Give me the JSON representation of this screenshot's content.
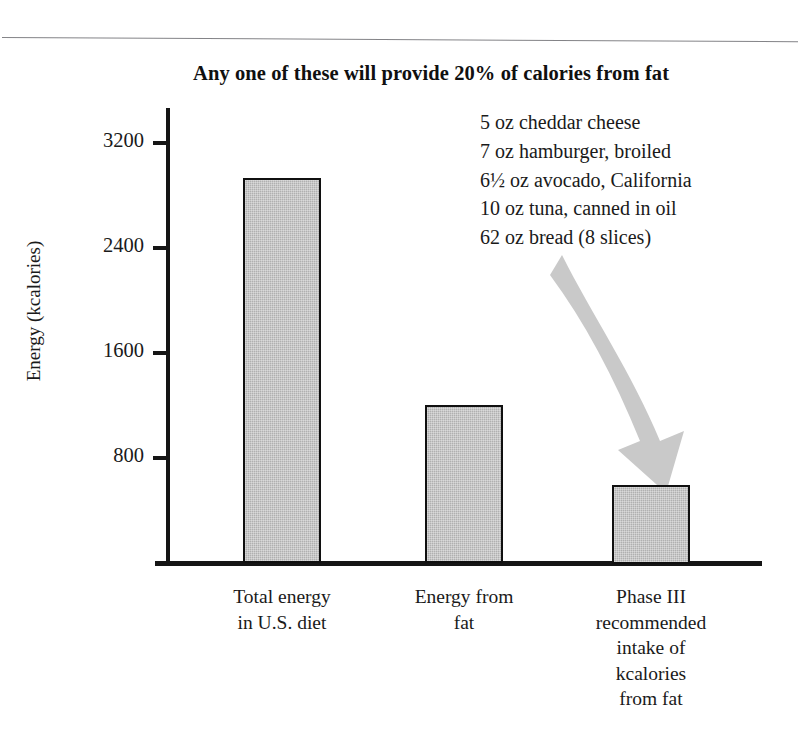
{
  "figure": {
    "title": "Any one of these will provide 20% of calories from fat",
    "y_axis_title": "Energy (kcalories)",
    "bar_fill_color": "#b0b0b0",
    "bar_border_color": "#101010",
    "arrow_color": "#c9c9c9"
  },
  "food_list": [
    "5 oz cheddar cheese",
    "7 oz hamburger, broiled",
    "6½ oz avocado, California",
    "10 oz tuna, canned in oil",
    "62 oz bread (8 slices)"
  ],
  "y_ticks": [
    {
      "label": "3200",
      "value": 3200
    },
    {
      "label": "2400",
      "value": 2400
    },
    {
      "label": "1600",
      "value": 1600
    },
    {
      "label": "800",
      "value": 800
    }
  ],
  "bars": [
    {
      "label_lines": [
        "Total energy",
        "in U.S. diet"
      ],
      "value": 2940
    },
    {
      "label_lines": [
        "Energy from",
        "fat"
      ],
      "value": 1210
    },
    {
      "label_lines": [
        "Phase III",
        "recommended",
        "intake of",
        "kcalories",
        "from fat"
      ],
      "value": 600
    }
  ],
  "chart_data": {
    "type": "bar",
    "title": "Any one of these will provide 20% of calories from fat",
    "xlabel": "",
    "ylabel": "Energy (kcalories)",
    "categories": [
      "Total energy in U.S. diet",
      "Energy from fat",
      "Phase III recommended intake of kcalories from fat"
    ],
    "values": [
      2940,
      1210,
      600
    ],
    "ylim": [
      0,
      3600
    ],
    "yticks": [
      800,
      1600,
      2400,
      3200
    ],
    "grid": false,
    "legend": "none",
    "annotations": [
      "Any one of these will provide 20% of calories from fat",
      "5 oz cheddar cheese",
      "7 oz hamburger, broiled",
      "6½ oz avocado, California",
      "10 oz tuna, canned in oil",
      "62 oz bread (8 slices)"
    ]
  }
}
